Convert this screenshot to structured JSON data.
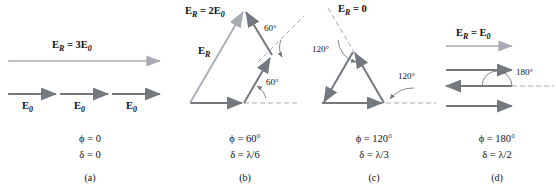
{
  "figure": {
    "type": "phasor-addition-diagram",
    "colors": {
      "resultant_vector": "#a9abb4",
      "component_vector": "#74787f",
      "dashed_reference": "#a9abb4",
      "angle_arc": "#74787f",
      "text": "#101010"
    }
  },
  "panels": [
    {
      "id": "a",
      "letter": "(a)",
      "resultant_label": "E_R = 3E_0",
      "resultant_label_parts": {
        "main": "E",
        "sub": "R",
        "equals": " = 3",
        "unit": "E",
        "unit_sub": "0"
      },
      "component_labels": [
        "E₀",
        "E₀",
        "E₀"
      ],
      "component_count": 3,
      "phi": "ϕ = 0",
      "delta": "δ = 0",
      "phi_value_deg": 0,
      "delta_value": "0",
      "resultant_magnitude": "3E₀",
      "angle_labels": []
    },
    {
      "id": "b",
      "letter": "(b)",
      "resultant_label": "E_R = 2E_0",
      "resultant_label_parts": {
        "main": "E",
        "sub": "R",
        "equals": " = 2",
        "unit": "E",
        "unit_sub": "0"
      },
      "resultant_short_label": "E_R",
      "component_count": 3,
      "phi": "ϕ = 60°",
      "delta": "δ = λ/6",
      "phi_value_deg": 60,
      "delta_value": "λ/6",
      "resultant_magnitude": "2E₀",
      "angle_labels": [
        "60°",
        "60°"
      ]
    },
    {
      "id": "c",
      "letter": "(c)",
      "resultant_label": "E_R = 0",
      "resultant_label_parts": {
        "main": "E",
        "sub": "R",
        "equals": " = 0",
        "unit": "",
        "unit_sub": ""
      },
      "component_count": 3,
      "phi": "ϕ = 120°",
      "delta": "δ = λ/3",
      "phi_value_deg": 120,
      "delta_value": "λ/3",
      "resultant_magnitude": "0",
      "angle_labels": [
        "120°",
        "120°"
      ]
    },
    {
      "id": "d",
      "letter": "(d)",
      "resultant_label": "E_R = E_0",
      "resultant_label_parts": {
        "main": "E",
        "sub": "R",
        "equals": " = ",
        "unit": "E",
        "unit_sub": "0"
      },
      "component_count": 3,
      "phi": "ϕ = 180°",
      "delta": "δ = λ/2",
      "phi_value_deg": 180,
      "delta_value": "λ/2",
      "resultant_magnitude": "E₀",
      "angle_labels": [
        "180°"
      ]
    }
  ]
}
